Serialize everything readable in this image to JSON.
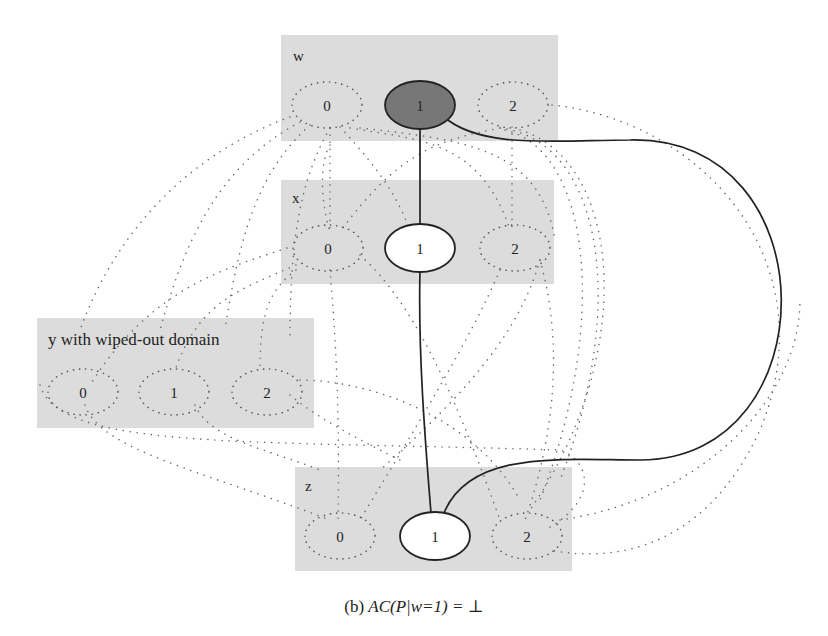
{
  "figure": {
    "caption_prefix": "(b)",
    "caption_math": "AC(P|w=1) = ⊥",
    "variables": [
      {
        "name": "w",
        "label": "w",
        "values": [
          "0",
          "1",
          "2"
        ],
        "assigned_value": "1"
      },
      {
        "name": "x",
        "label": "x",
        "values": [
          "0",
          "1",
          "2"
        ],
        "supported_value": "1"
      },
      {
        "name": "y",
        "label": "y with wiped-out domain",
        "values": [
          "0",
          "1",
          "2"
        ],
        "wiped_out": true
      },
      {
        "name": "z",
        "label": "z",
        "values": [
          "0",
          "1",
          "2"
        ],
        "supported_value": "1"
      }
    ],
    "solid_edges": [
      {
        "from": "w=1",
        "to": "x=1"
      },
      {
        "from": "x=1",
        "to": "z=1"
      },
      {
        "from": "w=1",
        "to": "z=1"
      }
    ],
    "legend": {
      "dotted": "pruned values / removed constraints",
      "solid": "remaining supports"
    }
  }
}
